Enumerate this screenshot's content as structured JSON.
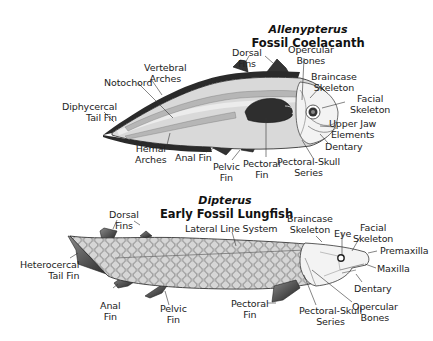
{
  "diagrams": [
    {
      "genus": "Allenypterus",
      "common_name": "Fossil Coelacanth",
      "labels": {
        "dorsal_fins": [
          "Dorsal",
          "Fins"
        ],
        "opercular_bones": [
          "Opercular",
          "Bones"
        ],
        "vertebral_arches": [
          "Vertebral",
          "Arches"
        ],
        "braincase_skeleton": [
          "Braincase",
          "Skeleton"
        ],
        "notochord": [
          "Notochord"
        ],
        "facial_skeleton": [
          "Facial",
          "Skeleton"
        ],
        "diphycercal_tail_fin": [
          "Diphycercal",
          "Tail Fin"
        ],
        "upper_jaw_elements": [
          "Upper Jaw",
          "Elements"
        ],
        "dentary": [
          "Dentary"
        ],
        "hemal_arches": [
          "Hemal",
          "Arches"
        ],
        "anal_fin": [
          "Anal Fin"
        ],
        "pelvic_fin": [
          "Pelvic",
          "Fin"
        ],
        "pectoral_fin": [
          "Pectoral",
          "Fin"
        ],
        "pectoral_skull_series": [
          "Pectoral-Skull",
          "Series"
        ]
      }
    },
    {
      "genus": "Dipterus",
      "common_name": "Early Fossil Lungfish",
      "labels": {
        "dorsal_fins": [
          "Dorsal",
          "Fins"
        ],
        "lateral_line_system": [
          "Lateral Line System"
        ],
        "braincase_skeleton": [
          "Braincase",
          "Skeleton"
        ],
        "eye": [
          "Eye"
        ],
        "facial_skeleton": [
          "Facial",
          "Skeleton"
        ],
        "premaxilla": [
          "Premaxilla"
        ],
        "heterocercal_tail_fin": [
          "Heterocercal",
          "Tail Fin"
        ],
        "maxilla": [
          "Maxilla"
        ],
        "dentary": [
          "Dentary"
        ],
        "anal_fin": [
          "Anal",
          "Fin"
        ],
        "pelvic_fin": [
          "Pelvic",
          "Fin"
        ],
        "pectoral_fin": [
          "Pectoral",
          "Fin"
        ],
        "pectoral_skull_series": [
          "Pectoral-Skull",
          "Series"
        ],
        "opercular_bones": [
          "Opercular",
          "Bones"
        ]
      }
    }
  ],
  "colors": {
    "body_fill": "#d9d9d9",
    "dark_fin": "#3a3a3a",
    "outline": "#222222",
    "label_text": "#222222"
  }
}
